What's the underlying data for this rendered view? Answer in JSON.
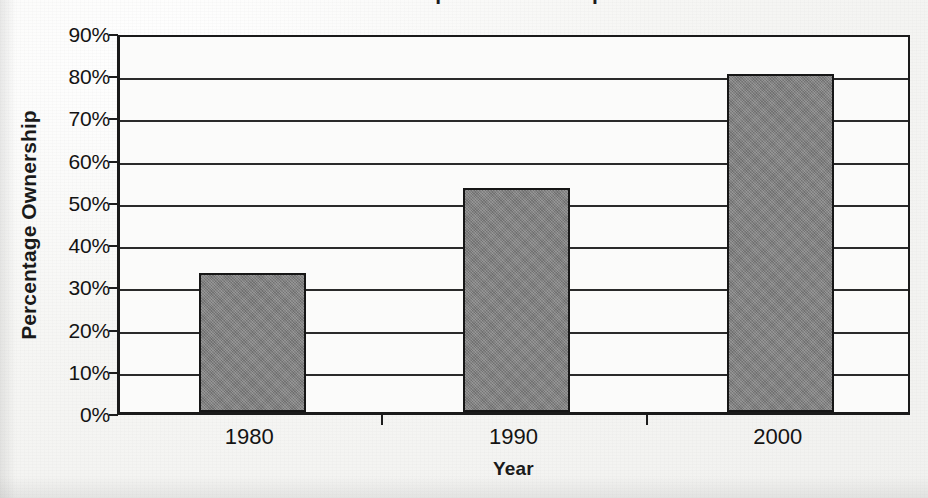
{
  "figure": {
    "title_cropped_remnant": "Home Computer Ownership",
    "background_color": "#f6f6f4",
    "ink_color": "#1a1a1a"
  },
  "chart_data": {
    "type": "bar",
    "title": "Home Computer Ownership",
    "xlabel": "Year",
    "ylabel": "Percentage Ownership",
    "categories": [
      "1980",
      "1990",
      "2000"
    ],
    "values": [
      33,
      53,
      80
    ],
    "value_labels": [
      "33%",
      "53%",
      "80%"
    ],
    "ylim": [
      0,
      90
    ],
    "ytick_values": [
      0,
      10,
      20,
      30,
      40,
      50,
      60,
      70,
      80,
      90
    ],
    "ytick_labels": [
      "0%",
      "10%",
      "20%",
      "30%",
      "40%",
      "50%",
      "60%",
      "70%",
      "80%",
      "90%"
    ],
    "ytick_step": 10,
    "grid": true,
    "grid_axis": "y",
    "legend": false,
    "legend_position": "none",
    "bar_color": "#808080",
    "bar_edge_color": "#161616",
    "series": [
      {
        "name": "Percentage Ownership",
        "values": [
          33,
          53,
          80
        ]
      }
    ]
  }
}
